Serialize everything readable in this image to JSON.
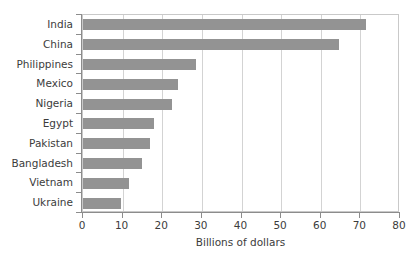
{
  "chart_data": {
    "type": "bar",
    "orientation": "horizontal",
    "title": "",
    "xlabel": "Billions of dollars",
    "ylabel": "",
    "categories": [
      "India",
      "China",
      "Philippines",
      "Mexico",
      "Nigeria",
      "Egypt",
      "Pakistan",
      "Bangladesh",
      "Vietnam",
      "Ukraine"
    ],
    "values": [
      71.5,
      64.5,
      28.5,
      24,
      22.5,
      18,
      17,
      15,
      11.5,
      9.5
    ],
    "xlim": [
      0,
      80
    ],
    "xticks": [
      0,
      10,
      20,
      30,
      40,
      50,
      60,
      70,
      80
    ],
    "xtick_labels": [
      "0",
      "10",
      "20",
      "30",
      "40",
      "50",
      "60",
      "70",
      "80"
    ],
    "grid": "vertical",
    "legend": "none",
    "bar_color": "#939393",
    "axis_color": "#8c8c8c",
    "gridline_color": "#d3d3d3",
    "text_color": "#3c3c3c",
    "background": "#ffffff"
  }
}
